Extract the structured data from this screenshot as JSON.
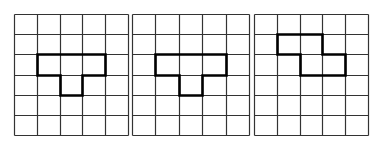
{
  "figure": {
    "grid_cols": 5,
    "grid_rows": 6,
    "grid_line_color": "#333333",
    "shape_outline_color": "#000000",
    "panels": [
      {
        "id": "panel-1",
        "shape": "T-tetromino",
        "cells": [
          [
            2,
            1
          ],
          [
            2,
            2
          ],
          [
            2,
            3
          ],
          [
            3,
            2
          ]
        ],
        "outline": [
          [
            1,
            2
          ],
          [
            4,
            2
          ],
          [
            4,
            3
          ],
          [
            3,
            3
          ],
          [
            3,
            4
          ],
          [
            2,
            4
          ],
          [
            2,
            3
          ],
          [
            1,
            3
          ]
        ]
      },
      {
        "id": "panel-2",
        "shape": "T-tetromino",
        "cells": [
          [
            2,
            1
          ],
          [
            2,
            2
          ],
          [
            2,
            3
          ],
          [
            3,
            2
          ]
        ],
        "outline": [
          [
            1,
            2
          ],
          [
            4,
            2
          ],
          [
            4,
            3
          ],
          [
            3,
            3
          ],
          [
            3,
            4
          ],
          [
            2,
            4
          ],
          [
            2,
            3
          ],
          [
            1,
            3
          ]
        ]
      },
      {
        "id": "panel-3",
        "shape": "Z-tetromino",
        "cells": [
          [
            1,
            1
          ],
          [
            1,
            2
          ],
          [
            2,
            2
          ],
          [
            2,
            3
          ]
        ],
        "outline": [
          [
            1,
            1
          ],
          [
            3,
            1
          ],
          [
            3,
            2
          ],
          [
            4,
            2
          ],
          [
            4,
            3
          ],
          [
            2,
            3
          ],
          [
            2,
            2
          ],
          [
            1,
            2
          ]
        ]
      }
    ]
  }
}
